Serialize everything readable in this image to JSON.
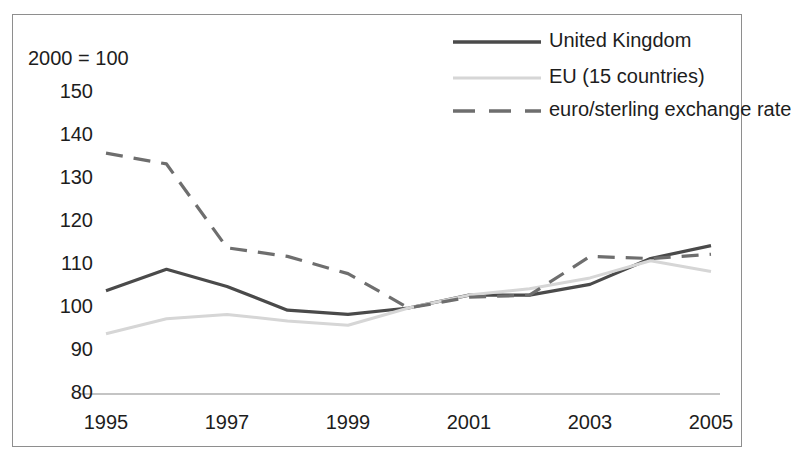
{
  "title_strip": "",
  "chart_data": {
    "type": "line",
    "title": "",
    "subtitle": "",
    "index_note": "2000 = 100",
    "xlabel": "",
    "ylabel": "",
    "x": [
      1995,
      1996,
      1997,
      1998,
      1999,
      2000,
      2001,
      2002,
      2003,
      2004,
      2005
    ],
    "x_tick_labels": [
      "1995",
      "1997",
      "1999",
      "2001",
      "2003",
      "2005"
    ],
    "x_tick_values": [
      1995,
      1997,
      1999,
      2001,
      2003,
      2005
    ],
    "xlim": [
      1995,
      2005
    ],
    "y_tick_labels": [
      "150",
      "140",
      "130",
      "120",
      "110",
      "100",
      "90",
      "80"
    ],
    "y_tick_values": [
      150,
      140,
      130,
      120,
      110,
      100,
      90,
      80
    ],
    "ylim": [
      80,
      150
    ],
    "grid": false,
    "legend_position": "top-right",
    "series": [
      {
        "name": "United Kingdom",
        "color": "#4a4a4a",
        "style": "solid",
        "width": 3.2,
        "values": [
          104,
          109,
          105,
          99.5,
          98.5,
          100,
          103,
          103,
          105.5,
          111.5,
          114.5
        ]
      },
      {
        "name": "EU (15 countries)",
        "color": "#d6d6d6",
        "style": "solid",
        "width": 3.0,
        "values": [
          94,
          97.5,
          98.5,
          97,
          96,
          100,
          103,
          104.5,
          107,
          111,
          108.5
        ]
      },
      {
        "name": "euro/sterling exchange rate",
        "color": "#6e6e6e",
        "style": "dashed",
        "width": 3.2,
        "values": [
          136,
          133.5,
          114,
          112,
          108,
          100,
          102.5,
          103,
          112,
          111.5,
          112.5
        ]
      }
    ]
  },
  "legend": {
    "items": [
      {
        "label": "United Kingdom",
        "color": "#4a4a4a",
        "style": "solid"
      },
      {
        "label": "EU (15 countries)",
        "color": "#d6d6d6",
        "style": "solid"
      },
      {
        "label": "euro/sterling exchange rate",
        "color": "#6e6e6e",
        "style": "dashed"
      }
    ]
  }
}
